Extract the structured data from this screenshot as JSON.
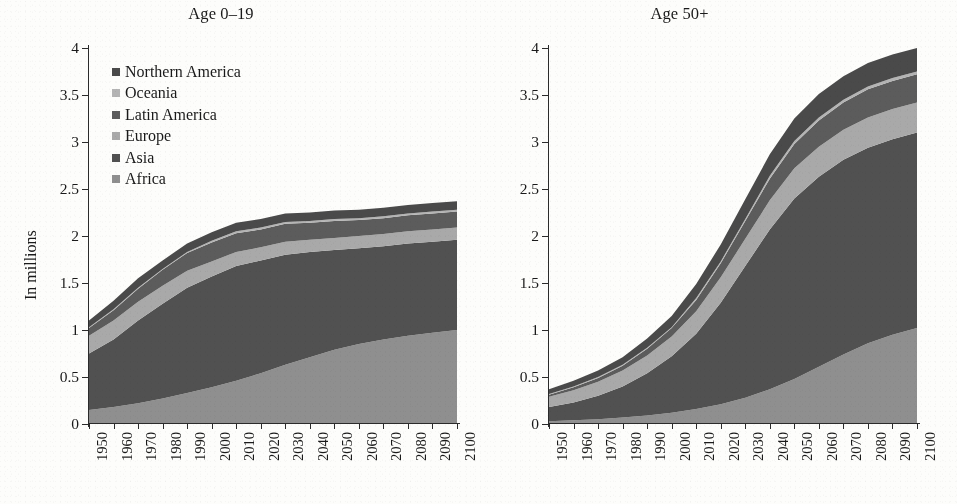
{
  "figure": {
    "ylabel": "In millions",
    "series_names": [
      "Northern America",
      "Oceania",
      "Latin America",
      "Europe",
      "Asia",
      "Africa"
    ],
    "colors": {
      "northern_america": "#4a4a4a",
      "oceania": "#b4b4b4",
      "latin_america": "#5c5c5c",
      "europe": "#a9a9a9",
      "asia": "#515151",
      "africa": "#8f8f8f",
      "axis": "#2b2b2b",
      "background": "#fdfdfb"
    }
  },
  "panels": [
    {
      "id": "left",
      "title": "Age 0–19",
      "legend": [
        {
          "label": "Northern America",
          "color": "#4a4a4a"
        },
        {
          "label": "Oceania",
          "color": "#b4b4b4"
        },
        {
          "label": "Latin America",
          "color": "#5c5c5c"
        },
        {
          "label": "Europe",
          "color": "#a9a9a9"
        },
        {
          "label": "Asia",
          "color": "#515151"
        },
        {
          "label": "Africa",
          "color": "#8f8f8f"
        }
      ]
    },
    {
      "id": "right",
      "title": "Age 50+",
      "legend": [
        {
          "label": "Northern America",
          "color": "#4a4a4a"
        },
        {
          "label": "Oceania",
          "color": "#b4b4b4"
        },
        {
          "label": "Latin America",
          "color": "#5c5c5c"
        },
        {
          "label": "Europe",
          "color": "#a9a9a9"
        },
        {
          "label": "Asia",
          "color": "#515151"
        },
        {
          "label": "Africa",
          "color": "#8f8f8f"
        }
      ]
    }
  ],
  "chart_data": [
    {
      "type": "area",
      "panel": "left",
      "title": "Age 0–19",
      "xlabel": "",
      "ylabel": "In millions",
      "stacked": true,
      "grid": false,
      "legend_position": "upper-left",
      "x": [
        1950,
        1960,
        1970,
        1980,
        1990,
        2000,
        2010,
        2020,
        2030,
        2040,
        2050,
        2060,
        2070,
        2080,
        2090,
        2100
      ],
      "xlim": [
        1950,
        2100
      ],
      "ylim": [
        0,
        4
      ],
      "yticks": [
        0,
        0.5,
        1,
        1.5,
        2,
        2.5,
        3,
        3.5,
        4
      ],
      "ytick_labels": [
        "0",
        "0.5",
        "1",
        "1.5",
        "2",
        "2.5",
        "3",
        "3.5",
        "4"
      ],
      "xtick_labels": [
        "1950",
        "1960",
        "1970",
        "1980",
        "1990",
        "2000",
        "2010",
        "2020",
        "2030",
        "2040",
        "2050",
        "2060",
        "2070",
        "2080",
        "2090",
        "2100"
      ],
      "stack_order_bottom_to_top": [
        "Africa",
        "Asia",
        "Europe",
        "Latin America",
        "Oceania",
        "Northern America"
      ],
      "series": [
        {
          "name": "Africa",
          "values": [
            0.15,
            0.18,
            0.22,
            0.27,
            0.33,
            0.39,
            0.46,
            0.54,
            0.63,
            0.71,
            0.79,
            0.85,
            0.9,
            0.94,
            0.97,
            1.0
          ]
        },
        {
          "name": "Asia",
          "values": [
            0.6,
            0.72,
            0.88,
            1.01,
            1.12,
            1.18,
            1.22,
            1.2,
            1.17,
            1.12,
            1.06,
            1.02,
            0.99,
            0.98,
            0.97,
            0.96
          ]
        },
        {
          "name": "Europe",
          "values": [
            0.19,
            0.2,
            0.2,
            0.19,
            0.18,
            0.16,
            0.15,
            0.14,
            0.14,
            0.13,
            0.13,
            0.13,
            0.13,
            0.13,
            0.13,
            0.13
          ]
        },
        {
          "name": "Latin America",
          "values": [
            0.08,
            0.11,
            0.14,
            0.17,
            0.19,
            0.2,
            0.2,
            0.19,
            0.19,
            0.18,
            0.18,
            0.17,
            0.17,
            0.17,
            0.17,
            0.17
          ]
        },
        {
          "name": "Oceania",
          "values": [
            0.01,
            0.01,
            0.01,
            0.01,
            0.01,
            0.02,
            0.02,
            0.02,
            0.02,
            0.02,
            0.02,
            0.02,
            0.02,
            0.02,
            0.02,
            0.02
          ]
        },
        {
          "name": "Northern America",
          "values": [
            0.07,
            0.09,
            0.1,
            0.09,
            0.09,
            0.09,
            0.09,
            0.09,
            0.09,
            0.09,
            0.09,
            0.09,
            0.09,
            0.09,
            0.09,
            0.09
          ]
        }
      ],
      "totals": [
        1.1,
        1.31,
        1.55,
        1.74,
        1.92,
        2.04,
        2.14,
        2.18,
        2.24,
        2.25,
        2.27,
        2.28,
        2.3,
        2.33,
        2.35,
        2.37
      ]
    },
    {
      "type": "area",
      "panel": "right",
      "title": "Age 50+",
      "xlabel": "",
      "ylabel": "In millions",
      "stacked": true,
      "grid": false,
      "legend_position": "upper-left",
      "x": [
        1950,
        1960,
        1970,
        1980,
        1990,
        2000,
        2010,
        2020,
        2030,
        2040,
        2050,
        2060,
        2070,
        2080,
        2090,
        2100
      ],
      "xlim": [
        1950,
        2100
      ],
      "ylim": [
        0,
        4
      ],
      "yticks": [
        0,
        0.5,
        1,
        1.5,
        2,
        2.5,
        3,
        3.5,
        4
      ],
      "ytick_labels": [
        "0",
        "0.5",
        "1",
        "1.5",
        "2",
        "2.5",
        "3",
        "3.5",
        "4"
      ],
      "xtick_labels": [
        "1950",
        "1960",
        "1970",
        "1980",
        "1990",
        "2000",
        "2010",
        "2020",
        "2030",
        "2040",
        "2050",
        "2060",
        "2070",
        "2080",
        "2090",
        "2100"
      ],
      "stack_order_bottom_to_top": [
        "Africa",
        "Asia",
        "Europe",
        "Latin America",
        "Oceania",
        "Northern America"
      ],
      "series": [
        {
          "name": "Africa",
          "values": [
            0.03,
            0.04,
            0.05,
            0.07,
            0.09,
            0.12,
            0.16,
            0.21,
            0.28,
            0.37,
            0.48,
            0.61,
            0.74,
            0.86,
            0.95,
            1.02
          ]
        },
        {
          "name": "Asia",
          "values": [
            0.15,
            0.19,
            0.25,
            0.33,
            0.45,
            0.6,
            0.8,
            1.08,
            1.4,
            1.7,
            1.92,
            2.02,
            2.07,
            2.08,
            2.08,
            2.08
          ]
        },
        {
          "name": "Europe",
          "values": [
            0.11,
            0.13,
            0.15,
            0.17,
            0.19,
            0.21,
            0.24,
            0.27,
            0.29,
            0.31,
            0.32,
            0.32,
            0.32,
            0.32,
            0.32,
            0.32
          ]
        },
        {
          "name": "Latin America",
          "values": [
            0.02,
            0.03,
            0.04,
            0.05,
            0.07,
            0.09,
            0.12,
            0.15,
            0.19,
            0.23,
            0.26,
            0.28,
            0.29,
            0.3,
            0.3,
            0.3
          ]
        },
        {
          "name": "Oceania",
          "values": [
            0.01,
            0.01,
            0.01,
            0.01,
            0.01,
            0.01,
            0.02,
            0.02,
            0.02,
            0.03,
            0.03,
            0.03,
            0.03,
            0.03,
            0.03,
            0.03
          ]
        },
        {
          "name": "Northern America",
          "values": [
            0.05,
            0.06,
            0.07,
            0.08,
            0.1,
            0.12,
            0.15,
            0.18,
            0.21,
            0.23,
            0.24,
            0.25,
            0.25,
            0.25,
            0.25,
            0.25
          ]
        }
      ],
      "totals": [
        0.37,
        0.46,
        0.57,
        0.71,
        0.91,
        1.15,
        1.49,
        1.91,
        2.39,
        2.87,
        3.25,
        3.51,
        3.7,
        3.84,
        3.93,
        4.0
      ]
    }
  ]
}
